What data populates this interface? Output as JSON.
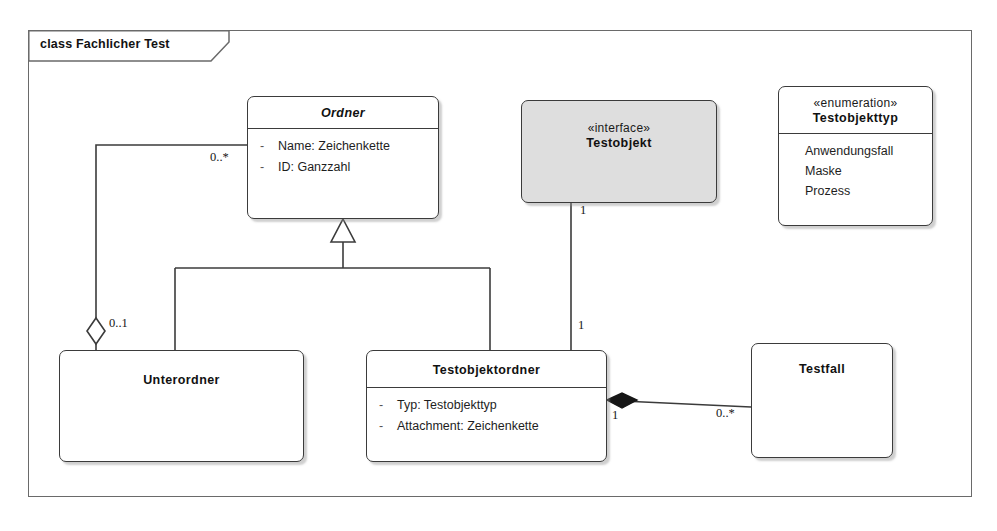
{
  "diagram": {
    "frame_label": "class Fachlicher Test",
    "kind": "uml-class-diagram"
  },
  "classes": {
    "ordner": {
      "name": "Ordner",
      "attributes": [
        {
          "visibility": "-",
          "text": "Name: Zeichenkette"
        },
        {
          "visibility": "-",
          "text": "ID: Ganzzahl"
        }
      ]
    },
    "testobjekt": {
      "stereotype": "«interface»",
      "name": "Testobjekt"
    },
    "testobjekttyp": {
      "stereotype": "«enumeration»",
      "name": "Testobjekttyp",
      "literals": [
        "Anwendungsfall",
        "Maske",
        "Prozess"
      ]
    },
    "unterordner": {
      "name": "Unterordner"
    },
    "testobjektordner": {
      "name": "Testobjektordner",
      "attributes": [
        {
          "visibility": "-",
          "text": "Typ: Testobjekttyp"
        },
        {
          "visibility": "-",
          "text": "Attachment: Zeichenkette"
        }
      ]
    },
    "testfall": {
      "name": "Testfall"
    }
  },
  "multiplicities": {
    "ordner_aggregation_source": "0..*",
    "unterordner_aggregation_target": "0..1",
    "testobjekt_end": "1",
    "testobjektordner_interface_end": "1",
    "testobjektordner_composition_end": "1",
    "testfall_end": "0..*"
  },
  "colors": {
    "line": "#3b3b3b",
    "frame": "#6a6a6a",
    "interface_fill": "#dedede",
    "box_fill": "#ffffff",
    "text": "#111111"
  }
}
